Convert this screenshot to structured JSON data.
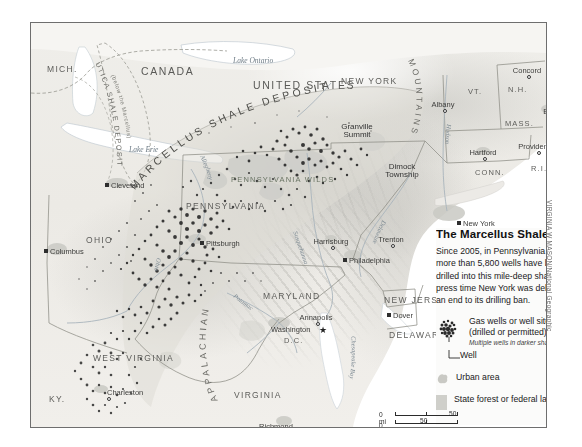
{
  "panel": {
    "title": "The Marcellus Shale",
    "body": "Since 2005, in Pennsylvania alone, more than 5,800 wells have been drilled into this mile-deep shale. At press time New York was debating an end to its drilling ban.",
    "legend": [
      {
        "label": "Gas wells or well sites (drilled or permitted)",
        "sub": "Multiple wells in darker shades",
        "icon": "well-cluster-icon"
      },
      {
        "label": "Well",
        "icon": "single-well-icon"
      },
      {
        "label": "Urban area",
        "icon": "urban-area-swatch"
      },
      {
        "label": "State forest or federal land",
        "icon": "forest-land-swatch"
      }
    ]
  },
  "scale": {
    "mi_zero": "0 mi",
    "mi_max": "50",
    "km_zero": "0 km",
    "km_max": "50"
  },
  "credit": "VIRGINIA W MASON/National Geographic",
  "colors": {
    "map_background": "#f2f1ee",
    "well_dot": "#2b2b2b",
    "urban": "#c9c9c4",
    "forest": "#cfcfca",
    "water": "#ffffff",
    "border": "#6e6e6e",
    "label_text": "#4a4a48"
  },
  "map": {
    "countries": [
      {
        "name": "CANADA",
        "x": 110,
        "y": 42
      },
      {
        "name": "UNITED STATES",
        "x": 222,
        "y": 56
      }
    ],
    "states": [
      {
        "name": "MICH.",
        "x": 16,
        "y": 41,
        "size": "state"
      },
      {
        "name": "NEW YORK",
        "x": 310,
        "y": 53,
        "size": "state"
      },
      {
        "name": "VT.",
        "x": 437,
        "y": 64,
        "size": "statesm"
      },
      {
        "name": "N.H.",
        "x": 477,
        "y": 62,
        "size": "statesm"
      },
      {
        "name": "MASS.",
        "x": 474,
        "y": 96,
        "size": "statesm"
      },
      {
        "name": "CONN.",
        "x": 444,
        "y": 145,
        "size": "statesm"
      },
      {
        "name": "R.I.",
        "x": 500,
        "y": 141,
        "size": "statesm"
      },
      {
        "name": "PENNSYLVANIA",
        "x": 155,
        "y": 178,
        "size": "state"
      },
      {
        "name": "OHIO",
        "x": 55,
        "y": 212,
        "size": "state"
      },
      {
        "name": "MARYLAND",
        "x": 232,
        "y": 268,
        "size": "state"
      },
      {
        "name": "NEW JERSEY",
        "x": 353,
        "y": 272,
        "size": "state"
      },
      {
        "name": "DELAWARE",
        "x": 358,
        "y": 307,
        "size": "state"
      },
      {
        "name": "WEST VIRGINIA",
        "x": 62,
        "y": 330,
        "size": "state"
      },
      {
        "name": "VIRGINIA",
        "x": 203,
        "y": 367,
        "size": "state"
      },
      {
        "name": "KY.",
        "x": 18,
        "y": 371,
        "size": "state"
      }
    ],
    "cities": [
      {
        "name": "Cleveland",
        "x": 80,
        "y": 158,
        "marker": "square",
        "anchor": "right"
      },
      {
        "name": "Columbus",
        "x": 19,
        "y": 224,
        "marker": "square",
        "anchor": "right"
      },
      {
        "name": "Pittsburgh",
        "x": 175,
        "y": 216,
        "marker": "square",
        "anchor": "right"
      },
      {
        "name": "Charleston",
        "x": 76,
        "y": 365,
        "marker": "circle",
        "anchor": "right"
      },
      {
        "name": "Albany",
        "x": 412,
        "y": 77,
        "marker": "circle",
        "anchor": "center"
      },
      {
        "name": "Concord",
        "x": 496,
        "y": 43,
        "marker": "circle",
        "anchor": "center"
      },
      {
        "name": "Boston",
        "x": 524,
        "y": 84,
        "marker": "circle",
        "anchor": "center"
      },
      {
        "name": "Hartford",
        "x": 452,
        "y": 125,
        "marker": "circle",
        "anchor": "center"
      },
      {
        "name": "Providence",
        "x": 506,
        "y": 119,
        "marker": "circle",
        "anchor": "center"
      },
      {
        "name": "New York",
        "x": 432,
        "y": 196,
        "marker": "square",
        "anchor": "right"
      },
      {
        "name": "Harrisburg",
        "x": 300,
        "y": 214,
        "marker": "circle",
        "anchor": "center"
      },
      {
        "name": "Trenton",
        "x": 360,
        "y": 212,
        "marker": "circle",
        "anchor": "center"
      },
      {
        "name": "Philadelphia",
        "x": 318,
        "y": 233,
        "marker": "square",
        "anchor": "left"
      },
      {
        "name": "Dover",
        "x": 362,
        "y": 288,
        "marker": "square",
        "anchor": "left"
      },
      {
        "name": "Annapolis",
        "x": 285,
        "y": 290,
        "marker": "circle",
        "anchor": "center"
      },
      {
        "name": "Washington",
        "x": 240,
        "y": 302,
        "marker": "star",
        "anchor": "right"
      },
      {
        "name": "Richmond",
        "x": 245,
        "y": 399,
        "marker": "circle",
        "anchor": "center"
      }
    ],
    "district": "D.C.",
    "places": [
      {
        "name": "Granville Summit",
        "x": 300,
        "y": 100
      },
      {
        "name": "Dimock Township",
        "x": 345,
        "y": 140
      }
    ],
    "parks": [
      {
        "name": "PENNSYLVANIA WILDS",
        "x": 200,
        "y": 152
      }
    ],
    "water_labels": [
      {
        "name": "Lake Ontario",
        "x": 202,
        "y": 33
      },
      {
        "name": "Lake Erie",
        "x": 98,
        "y": 122
      },
      {
        "name": "Chesapeake Bay",
        "x": 330,
        "y": 340
      },
      {
        "name": "Hudson",
        "x": 416,
        "y": 112
      },
      {
        "name": "Allegheny",
        "x": 178,
        "y": 140
      },
      {
        "name": "Ohio",
        "x": 120,
        "y": 252
      },
      {
        "name": "Susquehanna",
        "x": 272,
        "y": 228
      },
      {
        "name": "Delaware",
        "x": 352,
        "y": 235
      },
      {
        "name": "Potomac",
        "x": 218,
        "y": 288
      }
    ],
    "deposits": [
      {
        "name": "UTICA SHALE DEPOSIT",
        "sub": "(below the Marcellus)"
      },
      {
        "name": "MARCELLUS SHALE DEPOSIT"
      }
    ],
    "ranges": [
      {
        "name": "MOUNTAINS"
      },
      {
        "name": "APPALACHIAN"
      }
    ]
  }
}
